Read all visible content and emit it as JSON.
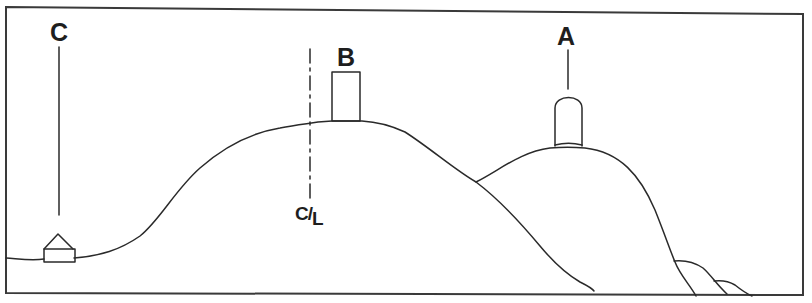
{
  "diagram": {
    "type": "cross-section sketch",
    "labels": {
      "C": "C",
      "B": "B",
      "A": "A",
      "centerline": {
        "main": "C",
        "slash": "/",
        "sub": "L"
      }
    },
    "features": [
      {
        "id": "C",
        "name": "house",
        "location": "low ground at left"
      },
      {
        "id": "B",
        "name": "rectangular structure",
        "location": "crest of large hill"
      },
      {
        "id": "A",
        "name": "dome-topped structure",
        "location": "crest of smaller right hill"
      },
      {
        "id": "C/L",
        "name": "centerline",
        "location": "dashed vertical line left of B"
      }
    ],
    "colors": {
      "line": "#2a2a2a",
      "background": "#ffffff"
    }
  }
}
